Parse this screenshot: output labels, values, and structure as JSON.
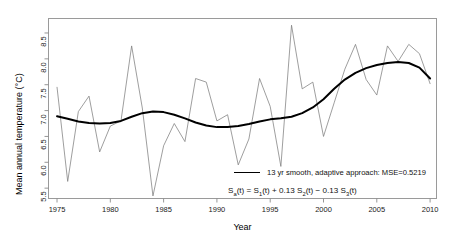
{
  "chart_data": {
    "type": "line",
    "title": "",
    "xlabel": "Year",
    "ylabel": "Mean annual temperature (°C)",
    "xlim": [
      1974.2,
      2010.6
    ],
    "ylim": [
      5.3,
      8.78
    ],
    "grid": false,
    "xticks": [
      1975,
      1980,
      1985,
      1990,
      1995,
      2000,
      2005,
      2010
    ],
    "xtick_labels": [
      "1975",
      "1980",
      "1985",
      "1990",
      "1995",
      "2000",
      "2005",
      "2010"
    ],
    "yticks": [
      5.5,
      6.0,
      6.5,
      7.0,
      7.5,
      8.0,
      8.5
    ],
    "ytick_labels": [
      "5.5",
      "6.0",
      "6.5",
      "7.0",
      "7.5",
      "8.0",
      "8.5"
    ],
    "legend_position": "inside-lower-right",
    "series": [
      {
        "name": "annual",
        "style": "thin-line",
        "color": "#7d7d7d",
        "x": [
          1975,
          1976,
          1977,
          1978,
          1979,
          1980,
          1981,
          1982,
          1983,
          1984,
          1985,
          1986,
          1987,
          1988,
          1989,
          1990,
          1991,
          1992,
          1993,
          1994,
          1995,
          1996,
          1997,
          1998,
          1999,
          2000,
          2001,
          2002,
          2003,
          2004,
          2005,
          2006,
          2007,
          2008,
          2009,
          2010
        ],
        "values": [
          7.45,
          5.63,
          6.98,
          7.28,
          6.2,
          6.7,
          6.8,
          8.25,
          7.05,
          5.35,
          6.32,
          6.75,
          6.4,
          7.62,
          7.55,
          6.8,
          6.92,
          5.95,
          6.45,
          7.62,
          7.08,
          5.92,
          8.65,
          7.42,
          7.55,
          6.5,
          7.15,
          7.8,
          8.28,
          7.6,
          7.3,
          8.25,
          7.95,
          8.28,
          8.1,
          7.52
        ]
      },
      {
        "name": "13 yr smooth, adaptive approach",
        "style": "thick-line",
        "color": "#000000",
        "x": [
          1975,
          1976,
          1977,
          1978,
          1979,
          1980,
          1981,
          1982,
          1983,
          1984,
          1985,
          1986,
          1987,
          1988,
          1989,
          1990,
          1991,
          1992,
          1993,
          1994,
          1995,
          1996,
          1997,
          1998,
          1999,
          2000,
          2001,
          2002,
          2003,
          2004,
          2005,
          2006,
          2007,
          2008,
          2009,
          2010
        ],
        "values": [
          6.89,
          6.84,
          6.79,
          6.76,
          6.75,
          6.76,
          6.8,
          6.88,
          6.95,
          6.98,
          6.97,
          6.92,
          6.85,
          6.77,
          6.71,
          6.68,
          6.68,
          6.7,
          6.74,
          6.79,
          6.83,
          6.85,
          6.88,
          6.95,
          7.06,
          7.22,
          7.42,
          7.6,
          7.73,
          7.82,
          7.88,
          7.92,
          7.94,
          7.92,
          7.83,
          7.62
        ]
      }
    ],
    "legend": [
      {
        "label": "13 yr smooth, adaptive approach: MSE=0.5219",
        "color": "#000000"
      }
    ],
    "annotations": [
      {
        "text": "Sa(t) = S1(t) + 0.13 S2(t) - 0.13 S3(t)",
        "html": "S<sub>a</sub>(t) = S<sub>1</sub>(t) + 0.13 S<sub>2</sub>(t) − 0.13 S<sub>3</sub>(t)"
      }
    ]
  }
}
